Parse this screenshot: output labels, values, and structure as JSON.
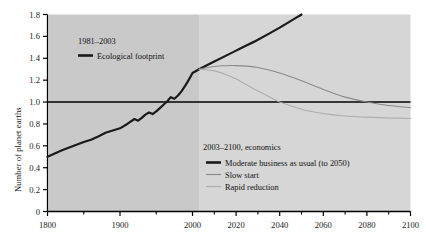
{
  "figure": {
    "kind": "scientific-line-chart",
    "background": "#ffffff",
    "plot_band_early_color": "#c9c9c9",
    "plot_band_late_color": "#d6d6d6",
    "band_split_year": 2003
  },
  "axes": {
    "y_label": "Number of planet earths",
    "y_ticks": [
      "0",
      "0.2",
      "0.4",
      "0.6",
      "0.8",
      "1.0",
      "1.2",
      "1.4",
      "1.6",
      "1.8"
    ],
    "y_tick_values": [
      0,
      0.2,
      0.4,
      0.6,
      0.8,
      1.0,
      1.2,
      1.4,
      1.6,
      1.8
    ],
    "y_min": 0,
    "y_max": 1.8,
    "x_label": "",
    "x_ticks": [
      "1800",
      "1900",
      "2000",
      "2020",
      "2040",
      "2060",
      "2080",
      "2100"
    ],
    "x_tick_values": [
      1800,
      1900,
      2000,
      2020,
      2040,
      2060,
      2080,
      2100
    ],
    "x_scale_note": "piecewise: 1800-2000 compressed by century, 2000-2100 by 20-year steps",
    "reference_line_y": 1.0,
    "reference_line_color": "#000000"
  },
  "legend_historical": {
    "title": "1981–2003",
    "items": [
      {
        "label": "Ecological footprint",
        "marker": "thick-black-line",
        "color": "#1a1a1a"
      }
    ]
  },
  "legend_scenarios": {
    "title": "2003–2100, economics",
    "items": [
      {
        "label": "Moderate business as usual (to 2050)",
        "marker": "thick-black-line",
        "color": "#1a1a1a"
      },
      {
        "label": "Slow start",
        "marker": "thin-gray-line",
        "color": "#8a8a8a"
      },
      {
        "label": "Rapid reduction",
        "marker": "thin-light-gray-line",
        "color": "#adadad"
      }
    ]
  },
  "chart_data": {
    "type": "line",
    "title": "",
    "xlabel": "",
    "ylabel": "Number of planet earths",
    "xlim": [
      1800,
      2100
    ],
    "ylim": [
      0,
      1.8
    ],
    "grid": false,
    "legend_position": "inside-upper-left and inside-lower-right",
    "annotations": [
      {
        "text": "reference line at 1.0 planet earths",
        "y": 1.0
      },
      {
        "text": "shaded band lightens after 2003 marking projection era",
        "x": 2003
      }
    ],
    "series": [
      {
        "name": "Ecological footprint",
        "color": "#1a1a1a",
        "width": 2.2,
        "style": "jagged-historical",
        "x": [
          1800,
          1810,
          1820,
          1830,
          1840,
          1850,
          1860,
          1870,
          1880,
          1890,
          1900,
          1910,
          1920,
          1925,
          1930,
          1935,
          1940,
          1945,
          1950,
          1955,
          1960,
          1965,
          1970,
          1975,
          1980,
          1985,
          1990,
          1995,
          2000,
          2003
        ],
        "y": [
          0.5,
          0.53,
          0.56,
          0.585,
          0.61,
          0.635,
          0.655,
          0.685,
          0.72,
          0.74,
          0.76,
          0.8,
          0.845,
          0.83,
          0.855,
          0.885,
          0.905,
          0.89,
          0.915,
          0.945,
          0.975,
          1.005,
          1.045,
          1.03,
          1.06,
          1.1,
          1.15,
          1.205,
          1.265,
          1.3
        ]
      },
      {
        "name": "Moderate business as usual (to 2050)",
        "color": "#1a1a1a",
        "width": 2.2,
        "style": "solid",
        "x": [
          2003,
          2010,
          2020,
          2030,
          2040,
          2050
        ],
        "y": [
          1.3,
          1.37,
          1.47,
          1.57,
          1.68,
          1.8
        ]
      },
      {
        "name": "Slow start",
        "color": "#8a8a8a",
        "width": 1.1,
        "style": "solid",
        "x": [
          2003,
          2010,
          2015,
          2020,
          2025,
          2030,
          2040,
          2050,
          2060,
          2070,
          2080,
          2090,
          2100
        ],
        "y": [
          1.3,
          1.325,
          1.332,
          1.333,
          1.328,
          1.315,
          1.265,
          1.195,
          1.115,
          1.045,
          1.0,
          0.968,
          0.95
        ]
      },
      {
        "name": "Rapid reduction",
        "color": "#adadad",
        "width": 1.1,
        "style": "solid",
        "x": [
          2003,
          2010,
          2015,
          2020,
          2025,
          2030,
          2035,
          2040,
          2050,
          2060,
          2070,
          2080,
          2090,
          2100
        ],
        "y": [
          1.3,
          1.285,
          1.255,
          1.21,
          1.155,
          1.1,
          1.05,
          1.0,
          0.935,
          0.895,
          0.872,
          0.862,
          0.855,
          0.85
        ]
      }
    ]
  }
}
